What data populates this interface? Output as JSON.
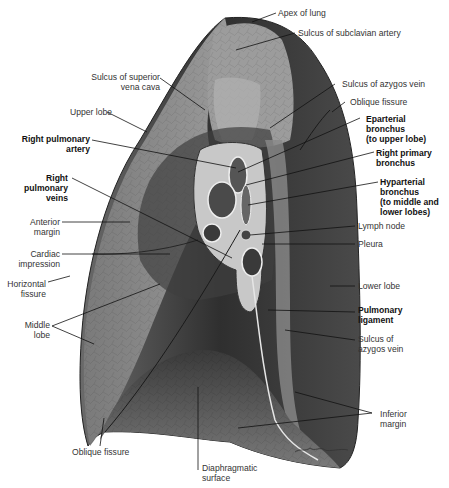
{
  "figure": {
    "signature": "Netter"
  },
  "labels": {
    "apex_of_lung": "Apex of lung",
    "sulcus_subclavian_artery": "Sulcus of subclavian artery",
    "sulcus_svc": "Sulcus of superior\nvena cava",
    "sulcus_azygos_top": "Sulcus of azygos vein",
    "oblique_fissure_top": "Oblique fissure",
    "upper_lobe": "Upper lobe",
    "right_pulmonary_artery": "Right pulmonary\nartery",
    "eparterial_bronchus": "Eparterial\nbronchus\n(to upper lobe)",
    "right_primary_bronchus": "Right primary\nbronchus",
    "right_pulmonary_veins": "Right\npulmonary\nveins",
    "hyparterial_bronchus": "Hyparterial\nbronchus\n(to middle and\nlower lobes)",
    "anterior_margin": "Anterior\nmargin",
    "lymph_node": "Lymph node",
    "cardiac_impression": "Cardiac\nimpression",
    "pleura": "Pleura",
    "horizontal_fissure": "Horizontal\nfissure",
    "lower_lobe": "Lower lobe",
    "middle_lobe": "Middle\nlobe",
    "pulmonary_ligament": "Pulmonary\nligament",
    "sulcus_azygos_bottom": "Sulcus of\nazygos vein",
    "inferior_margin": "Inferior\nmargin",
    "oblique_fissure_bottom": "Oblique fissure",
    "diaphragmatic_surface": "Diaphragmatic\nsurface"
  },
  "colors": {
    "background": "#ffffff",
    "lung_light": "#8a8a8a",
    "lung_mid": "#5e5e5e",
    "lung_dark": "#2e2e2e",
    "leader_line": "#111111",
    "label_text": "#333333"
  }
}
